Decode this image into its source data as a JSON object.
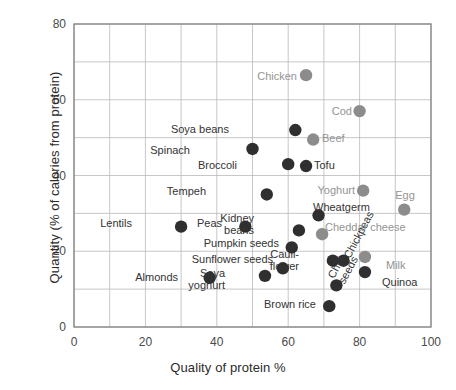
{
  "chart_data": {
    "type": "scatter",
    "title": "",
    "xlabel": "Quality of protein %",
    "ylabel": "Quantity (% of calories from protein)",
    "xlim": [
      0,
      100
    ],
    "ylim": [
      0,
      80
    ],
    "xticks": [
      0,
      20,
      40,
      60,
      80,
      100
    ],
    "yticks": [
      0,
      20,
      40,
      60,
      80
    ],
    "xtick_labels": [
      "0",
      "20",
      "40",
      "60",
      "80",
      "100"
    ],
    "ytick_labels": [
      "0",
      "20",
      "40",
      "60",
      "80"
    ],
    "grid": true,
    "grid_minor_step": 10,
    "legend": "none",
    "colors": {
      "plant": "#2f2f2f",
      "animal": "#8c8c8c",
      "grid": "#b9b9b9",
      "axis": "#8a8a8a",
      "label_plant": "#333333",
      "label_animal": "#949494"
    },
    "series": [
      {
        "name": "Plant foods",
        "color": "#2f2f2f",
        "points": [
          {
            "label": "Soya beans",
            "x": 62.0,
            "y": 52.0,
            "lx": 229,
            "ly": 124,
            "anchor": "end"
          },
          {
            "label": "Spinach",
            "x": 50.0,
            "y": 47.0,
            "lx": 190,
            "ly": 145,
            "anchor": "end"
          },
          {
            "label": "Broccoli",
            "x": 60.0,
            "y": 43.0,
            "lx": 237,
            "ly": 160,
            "anchor": "end"
          },
          {
            "label": "Tofu",
            "x": 65.0,
            "y": 42.5,
            "lx": 314,
            "ly": 160,
            "anchor": "start"
          },
          {
            "label": "Tempeh",
            "x": 54.0,
            "y": 35.0,
            "lx": 206,
            "ly": 186,
            "anchor": "end"
          },
          {
            "label": "Wheatgerm",
            "x": 68.5,
            "y": 29.5,
            "lx": 313,
            "ly": 202,
            "anchor": "start"
          },
          {
            "label": "Lentils",
            "x": 30.0,
            "y": 26.5,
            "lx": 132,
            "ly": 218,
            "anchor": "end"
          },
          {
            "label": "Peas",
            "x": 48.0,
            "y": 26.5,
            "lx": 222,
            "ly": 218,
            "anchor": "end"
          },
          {
            "label": "Kidney beans",
            "x": 63.0,
            "y": 25.5,
            "lx": 254,
            "ly": 213,
            "anchor": "end",
            "multiline": "Kidney|beans"
          },
          {
            "label": "Pumpkin seeds",
            "x": 61.0,
            "y": 21.0,
            "lx": 279,
            "ly": 238,
            "anchor": "end"
          },
          {
            "label": "Sunflower seeds",
            "x": 58.5,
            "y": 15.5,
            "lx": 273,
            "ly": 254,
            "anchor": "end"
          },
          {
            "label": "Cauliflower",
            "x": 72.5,
            "y": 17.5,
            "lx": 299,
            "ly": 249,
            "anchor": "end",
            "multiline": "Cauli-|flower"
          },
          {
            "label": "Almonds",
            "x": 38.0,
            "y": 13.0,
            "lx": 178,
            "ly": 272,
            "anchor": "end"
          },
          {
            "label": "Soya yoghurt",
            "x": 53.5,
            "y": 13.5,
            "lx": 225,
            "ly": 268,
            "anchor": "end",
            "multiline": "Soya|yoghurt"
          },
          {
            "label": "Brown rice",
            "x": 71.5,
            "y": 5.5,
            "lx": 316,
            "ly": 299,
            "anchor": "end"
          },
          {
            "label": "Chickpeas",
            "x": 75.5,
            "y": 17.5,
            "lx": 342,
            "ly": 255,
            "anchor": "rot",
            "rotate": -62
          },
          {
            "label": "Chia seeds",
            "x": 73.5,
            "y": 11.0,
            "lx": 326,
            "ly": 275,
            "anchor": "rot",
            "rotate": -62,
            "multiline": "Chia|seeds"
          },
          {
            "label": "Quinoa",
            "x": 81.5,
            "y": 14.5,
            "lx": 382,
            "ly": 277,
            "anchor": "start"
          }
        ]
      },
      {
        "name": "Animal foods",
        "color": "#8c8c8c",
        "points": [
          {
            "label": "Chicken",
            "x": 65.0,
            "y": 66.5,
            "lx": 297,
            "ly": 71,
            "anchor": "end"
          },
          {
            "label": "Cod",
            "x": 80.0,
            "y": 57.0,
            "lx": 352,
            "ly": 106,
            "anchor": "end"
          },
          {
            "label": "Beef",
            "x": 67.0,
            "y": 49.5,
            "lx": 322,
            "ly": 133,
            "anchor": "start"
          },
          {
            "label": "Yoghurt",
            "x": 81.0,
            "y": 36.0,
            "lx": 355,
            "ly": 185,
            "anchor": "end"
          },
          {
            "label": "Egg",
            "x": 92.5,
            "y": 31.0,
            "lx": 405,
            "ly": 190,
            "anchor": "mid"
          },
          {
            "label": "Cheddar cheese",
            "x": 69.5,
            "y": 24.5,
            "lx": 325,
            "ly": 222,
            "anchor": "start"
          },
          {
            "label": "Milk",
            "x": 81.5,
            "y": 18.5,
            "lx": 386,
            "ly": 260,
            "anchor": "start"
          }
        ]
      }
    ]
  },
  "axes": {
    "x_title": "Quality of protein %",
    "y_title": "Quantity (% of calories from protein)"
  }
}
